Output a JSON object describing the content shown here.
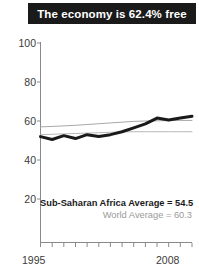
{
  "title": {
    "text": "The economy is 62.4% free"
  },
  "legend": {
    "series1": "Sub-Saharan Africa Average = 54.5",
    "series2": "World Average = 60.3"
  },
  "axis": {
    "y_ticks": [
      "100",
      "80",
      "60",
      "40",
      "20"
    ],
    "x_start": "1995",
    "x_end": "2008"
  },
  "chart_data": {
    "type": "line",
    "title": "The economy is 62.4% free",
    "xlabel": "",
    "ylabel": "",
    "xlim": [
      1995,
      2008
    ],
    "ylim": [
      0,
      100
    ],
    "ytick_values": [
      20,
      40,
      60,
      80,
      100
    ],
    "xtick_values": [
      1995,
      1996,
      1997,
      1998,
      1999,
      2000,
      2001,
      2002,
      2003,
      2004,
      2005,
      2006,
      2007,
      2008
    ],
    "xtick_labels_shown": [
      "1995",
      "2008"
    ],
    "grid": false,
    "legend_position": "inside-bottom-right",
    "x": [
      1995,
      1996,
      1997,
      1998,
      1999,
      2000,
      2001,
      2002,
      2003,
      2004,
      2005,
      2006,
      2007,
      2008
    ],
    "series": [
      {
        "name": "Country score",
        "label": "Sub-Saharan Africa Average = 54.5",
        "color": "#1a1a1a",
        "width": 3.0,
        "values": [
          52.0,
          50.5,
          52.5,
          51.0,
          53.0,
          52.0,
          53.0,
          54.5,
          56.5,
          58.5,
          61.5,
          60.5,
          61.5,
          62.4
        ]
      },
      {
        "name": "World Average",
        "label": "World Average = 60.3",
        "color": "#a8a8a8",
        "width": 1.0,
        "values": [
          57.0,
          57.2,
          57.5,
          57.8,
          58.2,
          58.6,
          59.0,
          59.4,
          59.8,
          60.0,
          60.1,
          60.2,
          60.3,
          60.3
        ]
      },
      {
        "name": "Sub-Saharan Africa Average",
        "label": "Sub-Saharan Africa Average = 54.5",
        "color": "#b8b8b8",
        "width": 1.0,
        "values": [
          53.0,
          53.2,
          53.4,
          53.6,
          53.8,
          54.0,
          54.2,
          54.4,
          54.5,
          54.5,
          54.5,
          54.5,
          54.5,
          54.5
        ]
      }
    ],
    "annotations": [
      {
        "text": "62.4%",
        "meaning": "final country economic freedom score"
      },
      {
        "text": "54.5",
        "meaning": "Sub-Saharan Africa average"
      },
      {
        "text": "60.3",
        "meaning": "World average"
      }
    ]
  }
}
